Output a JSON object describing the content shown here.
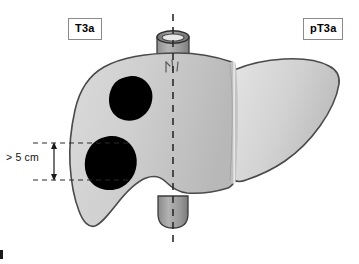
{
  "figure": {
    "width": 359,
    "height": 264,
    "background_color": "#ffffff"
  },
  "labels": {
    "clinical_stage": "T3a",
    "pathologic_stage": "pT3a"
  },
  "measurement": {
    "text": "> 5 cm",
    "description": "Vertical extent of the larger tumor nodule",
    "arrow_style": "double-headed",
    "guide_line_style": "dashed",
    "top_guide_y": 143,
    "bottom_guide_y": 180
  },
  "anatomy": {
    "organ": "liver",
    "lobes": [
      "right lobe",
      "left lobe"
    ],
    "fissure": "falciform ligament / interlobar fissure",
    "vessels": [
      {
        "name": "inferior vena cava (suprahepatic)",
        "position": "superior"
      },
      {
        "name": "inferior vena cava (infrahepatic)",
        "position": "inferior"
      }
    ],
    "midline": {
      "name": "vertical reference axis",
      "style": "dashed",
      "x": 173
    },
    "tumors": [
      {
        "name": "tumor-nodule-upper",
        "cx": 131,
        "cy": 98,
        "r": 22
      },
      {
        "name": "tumor-nodule-lower",
        "cx": 108,
        "cy": 162,
        "r": 26
      }
    ]
  },
  "colors": {
    "liver_fill_light": "#d9d9d9",
    "liver_fill_mid": "#c8c8c8",
    "liver_fill_dark": "#b4b4b4",
    "liver_outline": "#4a4a4a",
    "tumor_fill": "#000000",
    "vessel_fill": "#9a9a9a",
    "vessel_outline": "#3c3c3c",
    "guide_line": "#2b2b2b",
    "label_border": "#8a8a8a",
    "label_text": "#000000",
    "background": "#ffffff"
  }
}
